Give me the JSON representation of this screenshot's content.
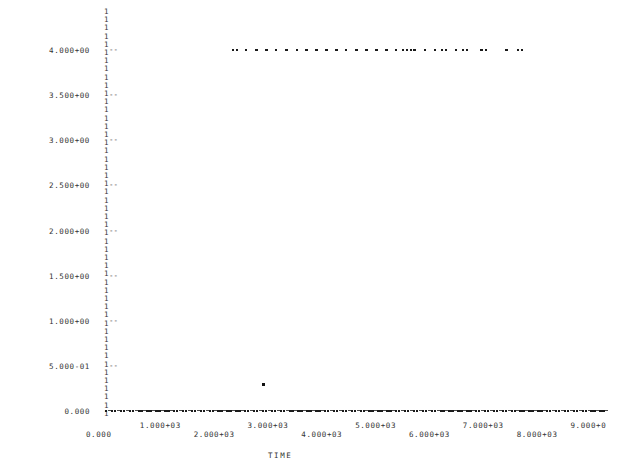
{
  "chart_data": {
    "type": "scatter",
    "title": "",
    "subtitle": "",
    "xlabel": "TIME",
    "ylabel": "",
    "grid": false,
    "legend": null,
    "style": "ascii-lineprinter-plot",
    "plot_symbol": "*",
    "axis_symbol": "1",
    "tick_symbol": "-",
    "xlim": [
      0,
      9400
    ],
    "ylim": [
      0,
      4250
    ],
    "y_tick_labels": [
      "4.000+00",
      "3.500+00",
      "3.000+00",
      "2.500+00",
      "2.000+00",
      "1.500+00",
      "1.000+00",
      "5.000-01",
      "0.000"
    ],
    "y_tick_values": [
      4000,
      3500,
      3000,
      2500,
      2000,
      1500,
      1000,
      500,
      0
    ],
    "x_tick_labels": [
      "0.000",
      "1.000+03",
      "2.000+03",
      "3.000+03",
      "4.000+03",
      "5.000+03",
      "6.000+03",
      "7.000+03",
      "8.000+03",
      "9.000+0"
    ],
    "x_tick_values": [
      0,
      1000,
      2000,
      3000,
      4000,
      5000,
      6000,
      7000,
      8000,
      9000
    ],
    "series": [
      {
        "name": "upper-level",
        "y_value": 4000,
        "x": [
          2400,
          2470,
          2640,
          2830,
          3020,
          3200,
          3390,
          3580,
          3760,
          3950,
          4130,
          4320,
          4500,
          4690,
          4880,
          5060,
          5250,
          5430,
          5560,
          5630,
          5700,
          5770,
          5960,
          6150,
          6280,
          6350,
          6540,
          6670,
          6740,
          7010,
          7100,
          7480,
          7690,
          7760
        ]
      },
      {
        "name": "baseline",
        "y_value": 0,
        "x": [
          40,
          95,
          150,
          205,
          260,
          315,
          370,
          425,
          480,
          535,
          590,
          645,
          700,
          755,
          810,
          865,
          920,
          975,
          1030,
          1085,
          1140,
          1195,
          1250,
          1305,
          1360,
          1415,
          1470,
          1525,
          1580,
          1635,
          1690,
          1745,
          1800,
          1855,
          1910,
          1965,
          2020,
          2075,
          2130,
          2185,
          2240,
          2295,
          2350,
          2405,
          2460,
          2515,
          2570,
          2625,
          2680,
          2735,
          2790,
          2845,
          2900,
          2955,
          3010,
          3065,
          3120,
          3175,
          3230,
          3285,
          3340,
          3395,
          3450,
          3505,
          3560,
          3615,
          3670,
          3725,
          3780,
          3835,
          3890,
          3945,
          4000,
          4055,
          4110,
          4165,
          4220,
          4275,
          4330,
          4385,
          4440,
          4495,
          4550,
          4605,
          4660,
          4715,
          4770,
          4825,
          4880,
          4935,
          4990,
          5045,
          5100,
          5155,
          5210,
          5265,
          5320,
          5375,
          5430,
          5485,
          5540,
          5595,
          5650,
          5705,
          5760,
          5815,
          5870,
          5925,
          5980,
          6035,
          6090,
          6145,
          6200,
          6255,
          6310,
          6365,
          6420,
          6475,
          6530,
          6585,
          6640,
          6695,
          6750,
          6805,
          6860,
          6915,
          6970,
          7025,
          7080,
          7135,
          7190,
          7245,
          7300,
          7355,
          7410,
          7465,
          7520,
          7575,
          7630,
          7685,
          7740,
          7795,
          7850,
          7905,
          7960,
          8015,
          8070,
          8125,
          8180,
          8235,
          8290,
          8345,
          8400,
          8455,
          8510,
          8565,
          8620,
          8675,
          8730,
          8785,
          8840,
          8895,
          8950,
          9005,
          9060,
          9115,
          9170,
          9225,
          9280,
          9335
        ]
      },
      {
        "name": "outlier",
        "y_value": 300,
        "x": [
          2950
        ]
      }
    ]
  }
}
